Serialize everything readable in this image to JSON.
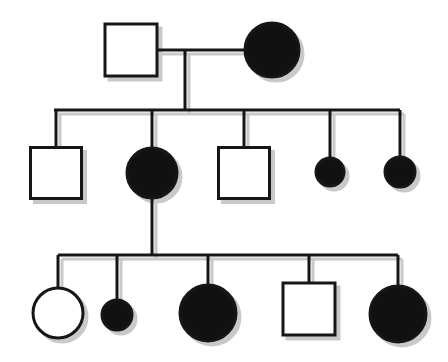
{
  "figure": {
    "kind": "pedigree-chart",
    "width": 448,
    "height": 362,
    "background_color": "#ffffff",
    "line_color": "#161616",
    "affected_fill": "#111111",
    "unaffected_fill": "#ffffff",
    "shadow_color": "#c9c9c9",
    "stroke_width": 3,
    "symbol_key": {
      "square": "male",
      "circle": "female",
      "filled": "affected",
      "open": "unaffected"
    }
  },
  "chart_data": {
    "type": "diagram",
    "generations": [
      {
        "id": "I",
        "label": "Generation I",
        "y": 50,
        "members": [
          {
            "id": "I-1",
            "shape": "square",
            "sex": "male",
            "status": "unaffected",
            "filled": false,
            "cx": 131,
            "cy": 50,
            "size": 52
          },
          {
            "id": "I-2",
            "shape": "circle",
            "sex": "female",
            "status": "affected",
            "filled": true,
            "cx": 272,
            "cy": 50,
            "r": 27
          }
        ]
      },
      {
        "id": "II",
        "label": "Generation II",
        "y": 173,
        "sibship_line_y": 110,
        "sibship_line_x1": 54,
        "sibship_line_x2": 400,
        "members": [
          {
            "id": "II-1",
            "shape": "square",
            "sex": "male",
            "status": "unaffected",
            "filled": false,
            "cx": 56,
            "cy": 173,
            "size": 51
          },
          {
            "id": "II-2",
            "shape": "circle",
            "sex": "female",
            "status": "affected",
            "filled": true,
            "cx": 152,
            "cy": 173,
            "r": 25
          },
          {
            "id": "II-3",
            "shape": "square",
            "sex": "male",
            "status": "unaffected",
            "filled": false,
            "cx": 244,
            "cy": 173,
            "size": 51
          },
          {
            "id": "II-4",
            "shape": "circle",
            "sex": "female",
            "status": "affected",
            "filled": true,
            "cx": 330,
            "cy": 172,
            "r": 14
          },
          {
            "id": "II-5",
            "shape": "circle",
            "sex": "female",
            "status": "affected",
            "filled": true,
            "cx": 400,
            "cy": 172,
            "r": 15
          }
        ]
      },
      {
        "id": "III",
        "label": "Generation III",
        "y": 313,
        "sibship_line_y": 255,
        "sibship_line_x1": 58,
        "sibship_line_x2": 398,
        "members": [
          {
            "id": "III-1",
            "shape": "circle",
            "sex": "female",
            "status": "unaffected",
            "filled": false,
            "cx": 58,
            "cy": 313,
            "r": 25
          },
          {
            "id": "III-2",
            "shape": "circle",
            "sex": "female",
            "status": "affected",
            "filled": true,
            "cx": 117,
            "cy": 315,
            "r": 15
          },
          {
            "id": "III-3",
            "shape": "circle",
            "sex": "female",
            "status": "affected",
            "filled": true,
            "cx": 208,
            "cy": 313,
            "r": 28
          },
          {
            "id": "III-4",
            "shape": "square",
            "sex": "male",
            "status": "unaffected",
            "filled": false,
            "cx": 309,
            "cy": 309,
            "size": 52
          },
          {
            "id": "III-5",
            "shape": "circle",
            "sex": "female",
            "status": "affected",
            "filled": true,
            "cx": 398,
            "cy": 314,
            "r": 28
          }
        ]
      }
    ],
    "matings": [
      {
        "id": "mating-I",
        "partners": [
          "I-1",
          "I-2"
        ],
        "line_y": 50,
        "line_x1": 157,
        "line_x2": 245,
        "descent_x": 185,
        "descent_y1": 50,
        "descent_y2": 110
      },
      {
        "id": "descent-II-2",
        "partners": [
          "II-2"
        ],
        "descent_x": 152,
        "descent_y1": 198,
        "descent_y2": 255
      }
    ],
    "counts": {
      "total_members": 12,
      "affected": 8,
      "unaffected": 4,
      "males": 4,
      "females": 8
    }
  }
}
